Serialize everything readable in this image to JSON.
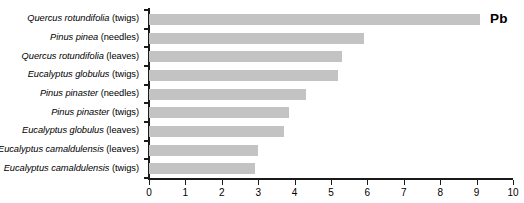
{
  "chart_data": {
    "type": "bar",
    "orientation": "horizontal",
    "title": "",
    "annotation": "Pb",
    "xlabel": "",
    "ylabel": "",
    "xlim": [
      0,
      10
    ],
    "xticks": [
      0,
      1,
      2,
      3,
      4,
      5,
      6,
      7,
      8,
      9,
      10
    ],
    "xtick_labels": [
      "0",
      "1",
      "2",
      "3",
      "4",
      "5",
      "6",
      "7",
      "8",
      "9",
      "10"
    ],
    "grid": false,
    "legend": false,
    "bar_color": "#c3c3c3",
    "axis_color": "#1a1a1a",
    "categories": [
      "Quercus rotundifolia (twigs)",
      "Pinus pinea (needles)",
      "Quercus rotundifolia (leaves)",
      "Eucalyptus globulus (twigs)",
      "Pinus pinaster (needles)",
      "Pinus pinaster (twigs)",
      "Eucalyptus globulus (leaves)",
      "Eucalyptus camaldulensis (leaves)",
      "Eucalyptus camaldulensis (twigs)"
    ],
    "category_parts": [
      {
        "species": "Quercus rotundifolia",
        "tissue": "(twigs)"
      },
      {
        "species": "Pinus pinea",
        "tissue": "(needles)"
      },
      {
        "species": "Quercus rotundifolia",
        "tissue": "(leaves)"
      },
      {
        "species": "Eucalyptus globulus",
        "tissue": "(twigs)"
      },
      {
        "species": "Pinus pinaster",
        "tissue": "(needles)"
      },
      {
        "species": "Pinus pinaster",
        "tissue": "(twigs)"
      },
      {
        "species": "Eucalyptus globulus",
        "tissue": "(leaves)"
      },
      {
        "species": "Eucalyptus camaldulensis",
        "tissue": "(leaves)"
      },
      {
        "species": "Eucalyptus camaldulensis",
        "tissue": "(twigs)"
      }
    ],
    "values": [
      9.1,
      5.9,
      5.3,
      5.2,
      4.3,
      3.85,
      3.7,
      3.0,
      2.9
    ]
  }
}
